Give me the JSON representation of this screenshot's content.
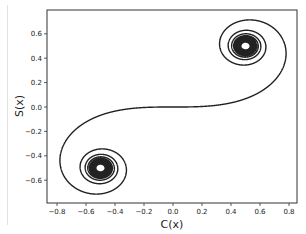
{
  "chart_data": {
    "type": "line",
    "title": "",
    "xlabel": "C(x)",
    "ylabel": "S(x)",
    "xlim": [
      -0.85,
      0.85
    ],
    "ylim": [
      -0.77,
      0.77
    ],
    "xticks": [
      -0.8,
      -0.6,
      -0.4,
      -0.2,
      0.0,
      0.2,
      0.4,
      0.6,
      0.8
    ],
    "xtick_labels": [
      "−0.8",
      "−0.6",
      "−0.4",
      "−0.2",
      "0.0",
      "0.2",
      "0.4",
      "0.6",
      "0.8"
    ],
    "yticks": [
      0.6,
      0.4,
      0.2,
      0.0,
      -0.2,
      -0.4,
      -0.6
    ],
    "ytick_labels": [
      "0.6",
      "0.4",
      "0.2",
      "0.0",
      "−0.2",
      "−0.4",
      "−0.6"
    ],
    "grid": false,
    "legend": null,
    "series": [
      {
        "name": "Cornu spiral",
        "parameter_range": [
          -10,
          10
        ],
        "convergence_points": [
          [
            0.5,
            0.5
          ],
          [
            -0.5,
            -0.5
          ]
        ],
        "key_points": [
          {
            "t": 0,
            "C": 0.0,
            "S": 0.0
          },
          {
            "t": 1.0,
            "C": 0.78,
            "S": 0.438
          },
          {
            "t": 1.5,
            "C": 0.446,
            "S": 0.697
          },
          {
            "t": 2.0,
            "C": 0.488,
            "S": 0.343
          },
          {
            "t": -1.0,
            "C": -0.78,
            "S": -0.438
          },
          {
            "t": -1.5,
            "C": -0.446,
            "S": -0.697
          },
          {
            "t": -2.0,
            "C": -0.488,
            "S": -0.343
          }
        ],
        "color": "#222222"
      }
    ]
  }
}
